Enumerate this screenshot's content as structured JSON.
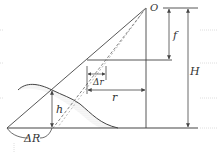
{
  "diagram": {
    "type": "relief-displacement-geometry",
    "labels": {
      "projection_center": "O",
      "focal_length": "f",
      "flying_height": "H",
      "image_displacement": "Δr",
      "radial_distance": "r",
      "object_height": "h",
      "ground_displacement": "ΔR"
    },
    "colors": {
      "line": "#444444",
      "dashed": "#666666",
      "hatch": "#999999",
      "scan_artifact": "#cccccc"
    }
  }
}
